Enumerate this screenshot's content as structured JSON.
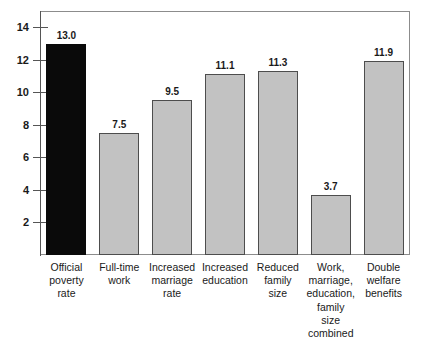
{
  "chart_data": {
    "type": "bar",
    "title": "",
    "subtitle": "",
    "xlabel": "",
    "ylabel": "",
    "ylim": [
      0,
      15
    ],
    "grid": false,
    "legend": "none",
    "yticks": [
      2,
      4,
      6,
      8,
      10,
      12,
      14
    ],
    "ytick_labels": [
      "2",
      "4",
      "6",
      "8",
      "10",
      "12",
      "14"
    ],
    "categories": [
      "Official poverty rate",
      "Full-time work",
      "Increased marriage rate",
      "Increased education",
      "Reduced family size",
      "Work, marriage, education, family size combined",
      "Double welfare benefits"
    ],
    "category_lines": [
      [
        "Official",
        "poverty",
        "rate"
      ],
      [
        "Full-time",
        "work"
      ],
      [
        "Increased",
        "marriage",
        "rate"
      ],
      [
        "Increased",
        "education"
      ],
      [
        "Reduced",
        "family",
        "size"
      ],
      [
        "Work,",
        "marriage,",
        "education,",
        "family",
        "size",
        "combined"
      ],
      [
        "Double",
        "welfare",
        "benefits"
      ]
    ],
    "values": [
      13.0,
      7.5,
      9.5,
      11.1,
      11.3,
      3.7,
      11.9
    ],
    "value_labels": [
      "13.0",
      "7.5",
      "9.5",
      "11.1",
      "11.3",
      "3.7",
      "11.9"
    ],
    "bar_colors": [
      "#0a0a0a",
      "#c2c2c2",
      "#c2c2c2",
      "#c2c2c2",
      "#c2c2c2",
      "#c2c2c2",
      "#c2c2c2"
    ],
    "highlight_index": 0
  },
  "colors": {
    "bar_gray": "#c2c2c2",
    "bar_black": "#0a0a0a",
    "bar_border": "#4d4d4d",
    "axis": "#555555",
    "frame": "#8c8c8c",
    "text": "#1a1a1a",
    "background": "#ffffff"
  }
}
